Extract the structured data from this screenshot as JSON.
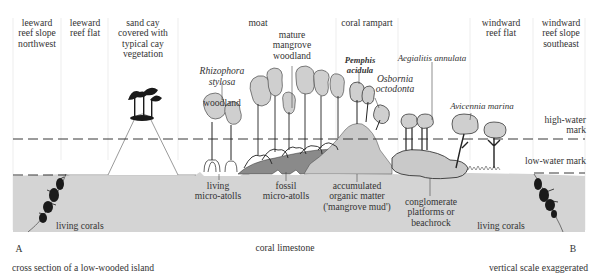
{
  "diagram": {
    "title": "cross section of a low-wooded island",
    "scale_note": "vertical scale exaggerated",
    "end_labels": {
      "start": "A",
      "end": "B"
    },
    "colors": {
      "background": "#ffffff",
      "coral_limestone": "#d4d4d4",
      "mangrove_mud": "#c9c9c9",
      "fossil_microatolls": "#8a8a8a",
      "tree_canopy": "#cfcfcf",
      "ink": "#222222",
      "separator": "#e6e6e6"
    },
    "zones": [
      {
        "id": "leeward-reef-slope",
        "label": "leeward\nreef slope\nnorthwest"
      },
      {
        "id": "leeward-reef-flat",
        "label": "leeward\nreef flat"
      },
      {
        "id": "sand-cay",
        "label": "sand cay\ncovered with\ntypical cay\nvegetation"
      },
      {
        "id": "moat",
        "label": "moat"
      },
      {
        "id": "coral-rampart",
        "label": "coral rampart"
      },
      {
        "id": "windward-reef-flat",
        "label": "windward\nreef flat"
      },
      {
        "id": "windward-reef-slope",
        "label": "windward\nreef slope\nsoutheast"
      }
    ],
    "vegetation_labels": {
      "rhizophora": "Rhizophora\nstylosa",
      "rhizophora_suffix": "woodland",
      "mature_mangrove": "mature\nmangrove\nwoodland",
      "pemphis": "Pemphis\nacidula",
      "osbornia": "Osbornia\noctodonta",
      "aegialitis": "Aegialitis annulata",
      "avicennia": "Avicennia marina"
    },
    "water_marks": {
      "high": "high-water\nmark",
      "low": "low-water mark"
    },
    "features": {
      "living_corals_left": "living corals",
      "living_corals_right": "living corals",
      "living_microatolls": "living\nmicro-atolls",
      "fossil_microatolls": "fossil\nmicro-atolls",
      "organic_matter": "accumulated\norganic matter\n('mangrove mud')",
      "conglomerate": "conglomerate\nplatforms or\nbeachrock",
      "coral_limestone": "coral limestone"
    }
  }
}
